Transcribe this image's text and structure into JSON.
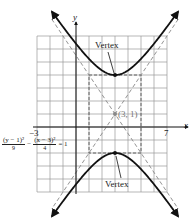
{
  "chart_data": {
    "type": "line",
    "title": "",
    "xlabel": "x",
    "ylabel": "y",
    "xlim": [
      -3,
      7
    ],
    "ylim": [
      -5,
      7
    ],
    "grid": true,
    "grid_step": 1,
    "tick_labels": {
      "x": [
        "-3",
        "7"
      ]
    },
    "equation": "(y - 1)^2/9 - (x - 3)^2/4 = 1",
    "center": {
      "x": 3,
      "y": 1,
      "label": "(3, 1)"
    },
    "vertices": [
      {
        "x": 3,
        "y": 4,
        "label": "Vertex"
      },
      {
        "x": 3,
        "y": -2,
        "label": "Vertex"
      }
    ],
    "asymptotes": [
      {
        "slope": 1.5,
        "point": [
          3,
          1
        ],
        "style": "dashed"
      },
      {
        "slope": -1.5,
        "point": [
          3,
          1
        ],
        "style": "dashed"
      }
    ],
    "fundamental_rectangle": {
      "x": [
        1,
        5
      ],
      "y": [
        -2,
        4
      ],
      "style": "dashed"
    },
    "series": [
      {
        "name": "upper branch",
        "equation": "y = 1 + 3*sqrt(1 + (x-3)^2/4)"
      },
      {
        "name": "lower branch",
        "equation": "y = 1 - 3*sqrt(1 + (x-3)^2/4)"
      }
    ]
  },
  "labels": {
    "x_axis": "x",
    "y_axis": "y",
    "x_min": "−3",
    "x_max": "7",
    "center": "(3, 1)",
    "vertex_top": "Vertex",
    "vertex_bottom": "Vertex",
    "eq_num1": "(y − 1)²",
    "eq_den1": "9",
    "eq_minus": "−",
    "eq_num2": "(x − 3)²",
    "eq_den2": "4",
    "eq_rhs": "= 1"
  }
}
